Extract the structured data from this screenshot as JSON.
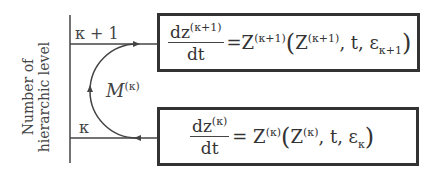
{
  "axis": {
    "label_line1": "Number of",
    "label_line2": "hierarchic level"
  },
  "levels": {
    "upper": "κ + 1",
    "lower": "κ"
  },
  "mapping": {
    "symbol": "M",
    "superscript": "(κ)"
  },
  "upper_equation": {
    "num": "dz",
    "num_sup": "(κ+1)",
    "den": "dt",
    "lhs": "=Z",
    "lhs_sup": "(κ+1)",
    "arg_z": "Z",
    "arg_z_sup": "(κ+1)",
    "arg_rest": ",  t, ε",
    "arg_sub": "κ+1"
  },
  "lower_equation": {
    "num": "dz",
    "num_sup": "(κ)",
    "den": "dt",
    "lhs": "= Z",
    "lhs_sup": "(κ)",
    "arg_z": "Z",
    "arg_z_sup": "(κ)",
    "arg_rest": ",  t, ε",
    "arg_sub": "κ"
  },
  "colors": {
    "line": "#444444",
    "box_border": "#333333"
  }
}
